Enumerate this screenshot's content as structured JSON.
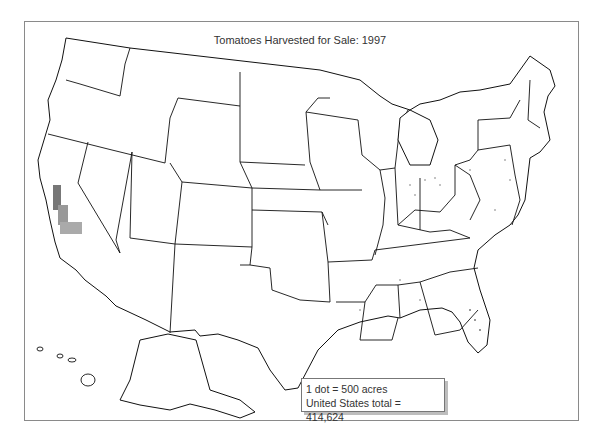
{
  "map": {
    "title": "Tomatoes Harvested for Sale:  1997",
    "type": "dot-density",
    "region": "United States",
    "year": "1997",
    "legend": {
      "dot_value": "1 dot = 500 acres",
      "total": "United States total = 414,624"
    },
    "colors": {
      "outline": "#111111",
      "dots": "#666666",
      "background": "#ffffff"
    },
    "high_density_areas": [
      "California Central Valley",
      "Florida",
      "Ohio",
      "Indiana",
      "New Jersey",
      "Maryland",
      "Virginia",
      "North Carolina",
      "Pennsylvania"
    ]
  }
}
